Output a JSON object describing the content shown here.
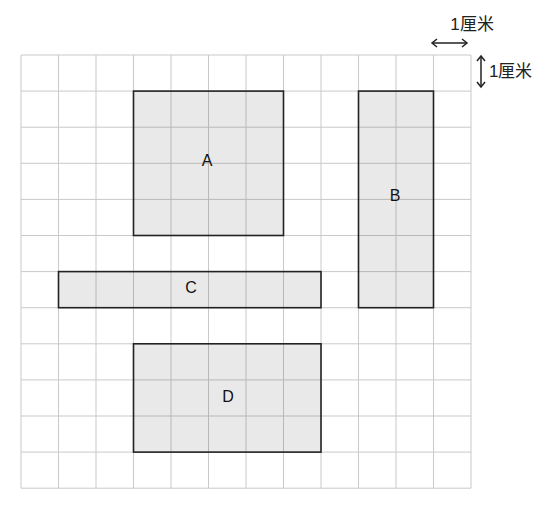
{
  "diagram": {
    "grid": {
      "cols": 12,
      "rows": 12,
      "left": 21,
      "top": 55,
      "cell_w": 37.5,
      "cell_h": 36.1,
      "line_color": "#c9c9c9"
    },
    "scale": {
      "horizontal_label": "1厘米",
      "vertical_label": "1厘米"
    },
    "shape_style": {
      "fill": "#e9e9e9",
      "stroke": "#222222"
    },
    "shapes": [
      {
        "label": "A",
        "col": 3,
        "row": 1,
        "w": 4,
        "h": 4,
        "label_x": 207,
        "label_y": 162
      },
      {
        "label": "B",
        "col": 9,
        "row": 1,
        "w": 2,
        "h": 6,
        "label_x": 395,
        "label_y": 197
      },
      {
        "label": "C",
        "col": 1,
        "row": 6,
        "w": 7,
        "h": 1,
        "label_x": 191,
        "label_y": 289
      },
      {
        "label": "D",
        "col": 3,
        "row": 8,
        "w": 5,
        "h": 3,
        "label_x": 228,
        "label_y": 398
      }
    ]
  }
}
